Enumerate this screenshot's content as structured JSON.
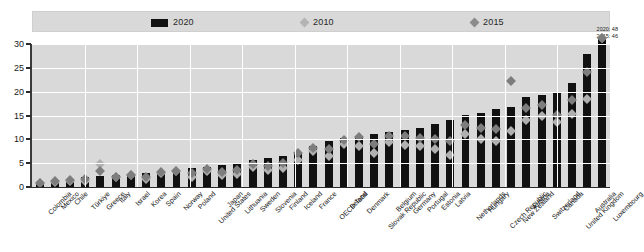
{
  "chart_data": {
    "type": "bar",
    "title": "",
    "xlabel": "",
    "ylabel": "",
    "ylim": [
      0,
      30
    ],
    "yticks": [
      0,
      5,
      10,
      15,
      20,
      25,
      30
    ],
    "grid": true,
    "legend_position": "top",
    "categories": [
      "Colombia",
      "Mexico",
      "Chile",
      "Türkiye",
      "Greece",
      "Italy",
      "Israel",
      "Korea",
      "Spain",
      "Norway",
      "Poland",
      "United States",
      "Japan",
      "Lithuania",
      "Sweden",
      "Slovenia",
      "Finland",
      "Iceland",
      "France",
      "OECD Total",
      "Ireland",
      "Denmark",
      "Slovak Republic",
      "Belgium",
      "Germany",
      "Portugal",
      "Estonia",
      "Latvia",
      "Netherlands",
      "Hungary",
      "Czech Republic",
      "New Zealand",
      "Austria",
      "Switzerland",
      "Canada",
      "United Kingdom",
      "Australia",
      "Luxembourg"
    ],
    "series": [
      {
        "name": "2020",
        "marker": "bar",
        "color": "#111111",
        "values": [
          1.0,
          1.4,
          1.6,
          2.0,
          2.3,
          2.6,
          2.8,
          3.0,
          3.4,
          3.6,
          4.0,
          4.2,
          4.6,
          5.0,
          5.6,
          6.0,
          6.6,
          7.4,
          8.6,
          9.6,
          10.2,
          10.8,
          11.2,
          11.6,
          12.0,
          12.4,
          13.2,
          14.0,
          15.2,
          15.6,
          16.4,
          16.8,
          18.8,
          19.2,
          20.0,
          21.8,
          28.0,
          48.0
        ]
      },
      {
        "name": "2010",
        "marker": "diamond",
        "color": "#b0b0b0",
        "values": [
          0.8,
          1.0,
          1.2,
          1.2,
          4.8,
          2.0,
          2.6,
          1.6,
          3.0,
          3.4,
          2.2,
          3.4,
          2.6,
          2.8,
          4.2,
          3.6,
          4.0,
          5.6,
          7.6,
          6.6,
          9.0,
          8.6,
          7.2,
          9.4,
          8.8,
          8.6,
          8.0,
          6.8,
          11.2,
          10.0,
          9.6,
          11.8,
          14.0,
          15.0,
          13.6,
          15.4,
          18.4,
          42.0
        ]
      },
      {
        "name": "2015",
        "marker": "diamond",
        "color": "#7d7d7d",
        "values": [
          0.9,
          1.2,
          1.4,
          1.6,
          3.4,
          2.2,
          2.6,
          2.2,
          3.2,
          3.4,
          3.0,
          3.8,
          3.2,
          3.6,
          4.8,
          4.4,
          5.0,
          7.2,
          8.2,
          8.0,
          9.8,
          10.4,
          9.0,
          10.6,
          10.6,
          10.2,
          10.0,
          9.6,
          13.0,
          12.4,
          12.2,
          22.2,
          16.6,
          17.2,
          15.2,
          18.2,
          24.2,
          46.0
        ]
      }
    ],
    "annotation": {
      "line1": "2020: 48",
      "line2": "2015: 46"
    }
  },
  "legend": {
    "items": [
      {
        "label": "2020"
      },
      {
        "label": "2010"
      },
      {
        "label": "2015"
      }
    ]
  }
}
